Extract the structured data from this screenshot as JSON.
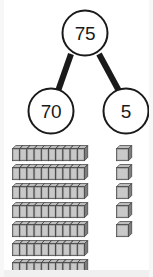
{
  "worksheet": {
    "title": "Number bond with base-ten blocks",
    "background_color": "#ffffff"
  },
  "number_bond": {
    "name": "number-bond",
    "total": "75",
    "parts": [
      "70",
      "5"
    ],
    "equation": "75 = 70 + 5",
    "circle_stroke_color": "#1a1a1a",
    "circle_fill_color": "#ffffff",
    "connector_color": "#1a1a1a",
    "text_color": "#1a1a1a",
    "circle_diameter": 46,
    "connector_width": 5,
    "total_circle": {
      "cx": 85,
      "cy": 33
    },
    "part_circles": [
      {
        "cx": 51,
        "cy": 111
      },
      {
        "cx": 126,
        "cy": 111
      }
    ]
  },
  "base_ten_blocks": {
    "name": "base-ten-blocks",
    "rods": {
      "label": "tens rods",
      "count": 7,
      "units_per_rod": 10,
      "value": 70,
      "rod_width": 72,
      "rod_height": 12,
      "row_spacing": 19,
      "first_row_top": 5,
      "left": 12
    },
    "cubes": {
      "label": "ones cubes",
      "count": 5,
      "units_per_cube": 1,
      "value": 5,
      "cube_size": 12,
      "item_spacing": 19,
      "first_item_top": 5,
      "left": 116
    },
    "total_value": 75,
    "colors": {
      "face_light": "#c9c9c9",
      "face_mid": "#a8a8a8",
      "face_dark": "#8c8c8c",
      "top_face": "#bdbdbd",
      "side_face": "#7d7d7d",
      "outline": "#3b3b3b"
    }
  }
}
